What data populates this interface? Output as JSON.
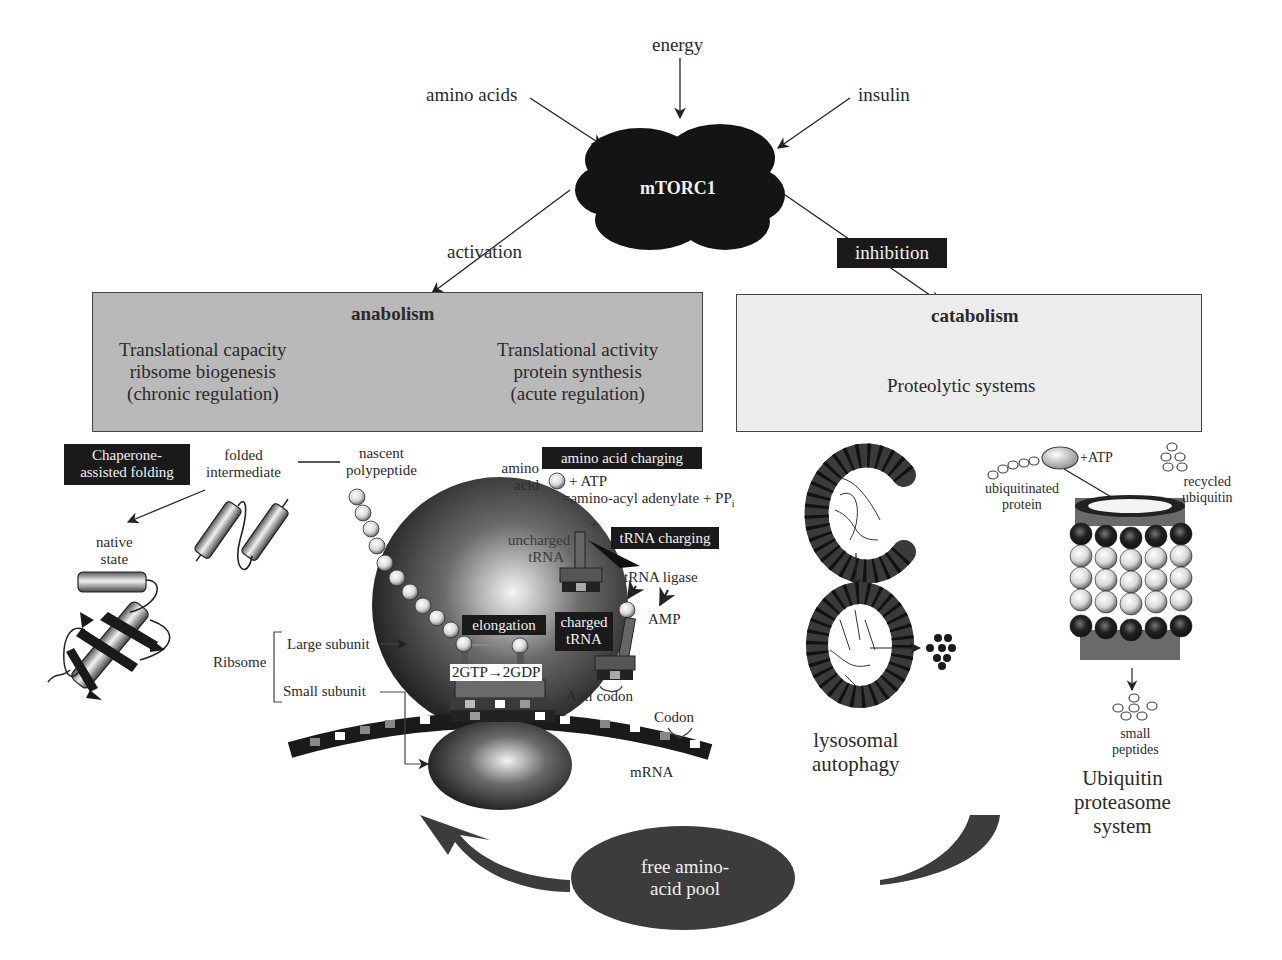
{
  "inputs": {
    "energy": "energy",
    "amino_acids": "amino acids",
    "insulin": "insulin"
  },
  "hub": {
    "label": "mTORC1",
    "color": "#141414"
  },
  "edges": {
    "activation": "activation",
    "inhibition": "inhibition"
  },
  "anabolism": {
    "title": "anabolism",
    "left": [
      "Translational capacity",
      "ribsome biogenesis",
      "(chronic regulation)"
    ],
    "right": [
      "Translational activity",
      "protein synthesis",
      "(acute regulation)"
    ],
    "fill": "#b9b9b9"
  },
  "catabolism": {
    "title": "catabolism",
    "subtitle": "Proteolytic systems",
    "fill": "#ececec"
  },
  "folding": {
    "chaperone": [
      "Chaperone-",
      "assisted folding"
    ],
    "folded_intermediate": [
      "folded",
      "intermediate"
    ],
    "native_state": [
      "native",
      "state"
    ],
    "nascent_polypeptide": [
      "nascent",
      "polypeptide"
    ]
  },
  "translation": {
    "amino_acid": [
      "amino",
      "acid"
    ],
    "amino_acid_charging": "amino acid charging",
    "plus_atp": "+ ATP",
    "adenylate": "=amino-acyl adenylate + PP",
    "adenylate_sub": "i",
    "plus": "+",
    "uncharged_trna": [
      "uncharged",
      "tRNA"
    ],
    "trna_charging": "tRNA charging",
    "trna_ligase": "tRNA ligase",
    "amp": "AMP",
    "elongation": "elongation",
    "charged_trna": [
      "charged",
      "tRNA"
    ],
    "gtp": "2GTP→2GDP",
    "anti_codon": "Anti codon",
    "codon": "Codon",
    "mrna": "mRNA",
    "ribosome": "Ribsome",
    "large_subunit": "Large subunit",
    "small_subunit": "Small subunit"
  },
  "autophagy": {
    "label": [
      "lysosomal",
      "autophagy"
    ]
  },
  "proteasome": {
    "plus_atp": "+ATP",
    "ubiquitinated_protein": [
      "ubiquitinated",
      "protein"
    ],
    "recycled_ubiquitin": [
      "recycled",
      "ubiquitin"
    ],
    "small_peptides": [
      "small",
      "peptides"
    ],
    "label": [
      "Ubiquitin",
      "proteasome",
      "system"
    ]
  },
  "pool": {
    "label": [
      "free amino-",
      "acid pool"
    ],
    "color": "#3c3c3c"
  }
}
